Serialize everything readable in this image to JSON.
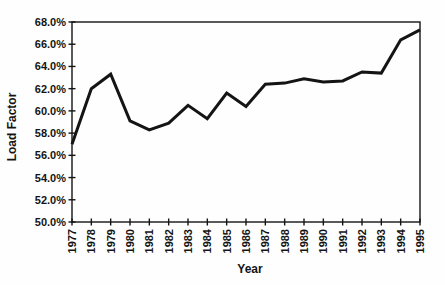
{
  "chart_data": {
    "type": "line",
    "title": "",
    "xlabel": "Year",
    "ylabel": "Load Factor",
    "x_labels": [
      "1977",
      "1978",
      "1979",
      "1980",
      "1981",
      "1982",
      "1983",
      "1984",
      "1985",
      "1986",
      "1987",
      "1988",
      "1989",
      "1990",
      "1991",
      "1992",
      "1993",
      "1994",
      "1995"
    ],
    "series": [
      {
        "name": "Load Factor",
        "values": [
          57.0,
          62.0,
          63.3,
          59.1,
          58.3,
          58.9,
          60.5,
          59.3,
          61.6,
          60.4,
          62.4,
          62.5,
          62.9,
          62.6,
          62.7,
          63.5,
          63.4,
          66.4,
          67.3
        ]
      }
    ],
    "ylim": [
      50,
      68
    ],
    "ytick_step": 2,
    "ytick_labels": [
      "68.0%",
      "66.0%",
      "64.0%",
      "62.0%",
      "60.0%",
      "58.0%",
      "56.0%",
      "54.0%",
      "52.0%",
      "50.0%"
    ],
    "grid": false,
    "legend": "none",
    "plot_frame": "box",
    "colors": {
      "line": "#141414",
      "axis": "#141414",
      "text": "#141414",
      "background": "#fefefe"
    }
  }
}
